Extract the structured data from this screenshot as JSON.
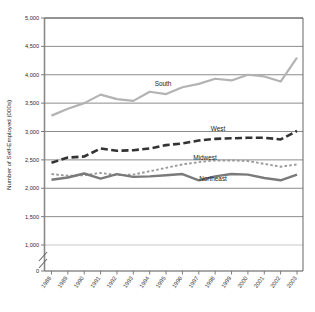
{
  "chart_data": {
    "type": "line",
    "title": "",
    "xlabel": "",
    "ylabel": "Number of Self-Employed (000s)",
    "ylim": [
      0,
      5000
    ],
    "ytick_labels": [
      "0",
      "1,000",
      "1,500",
      "2,000",
      "2,500",
      "3,000",
      "3,500",
      "4,000",
      "4,500",
      "5,000"
    ],
    "yticks": [
      0,
      1000,
      1500,
      2000,
      2500,
      3000,
      3500,
      4000,
      4500,
      5000
    ],
    "grid": true,
    "axis_break": true,
    "legend_position": "inline-annotations",
    "categories": [
      "1988",
      "1989",
      "1990",
      "1991",
      "1992",
      "1993",
      "1994",
      "1995",
      "1996",
      "1997",
      "1998",
      "1999",
      "2000",
      "2001",
      "2002",
      "2003"
    ],
    "x": [
      1988,
      1989,
      1990,
      1991,
      1992,
      1993,
      1994,
      1995,
      1996,
      1997,
      1998,
      1999,
      2000,
      2001,
      2002,
      2003
    ],
    "series": [
      {
        "name": "South",
        "style": "solid-light",
        "color": "#b3b3b3",
        "label": "South",
        "values": [
          3280,
          3400,
          3500,
          3650,
          3570,
          3540,
          3700,
          3660,
          3780,
          3840,
          3930,
          3900,
          4000,
          3970,
          3880,
          4300
        ]
      },
      {
        "name": "West",
        "style": "dashed",
        "color": "#333333",
        "label": "West",
        "values": [
          2450,
          2540,
          2560,
          2700,
          2660,
          2670,
          2700,
          2760,
          2790,
          2840,
          2870,
          2880,
          2890,
          2890,
          2860,
          3010
        ]
      },
      {
        "name": "Midwest",
        "style": "dotted",
        "color": "#999999",
        "label": "Midwest",
        "values": [
          2250,
          2220,
          2230,
          2270,
          2230,
          2240,
          2300,
          2360,
          2420,
          2460,
          2490,
          2490,
          2480,
          2430,
          2380,
          2420
        ]
      },
      {
        "name": "Northeast",
        "style": "solid-medium",
        "color": "#7a7a7a",
        "label": "Northeast",
        "values": [
          2150,
          2190,
          2260,
          2170,
          2250,
          2200,
          2210,
          2230,
          2250,
          2140,
          2210,
          2250,
          2240,
          2180,
          2140,
          2240
        ]
      }
    ]
  },
  "annotations": {
    "south": "South",
    "west": "West",
    "midwest": "Midwest",
    "northeast": "Northeast"
  }
}
